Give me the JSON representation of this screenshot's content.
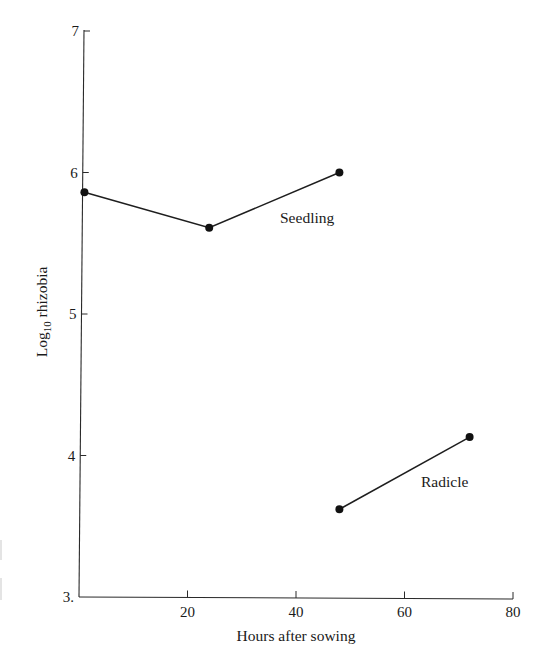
{
  "chart_data": {
    "type": "line",
    "title": "",
    "xlabel": "Hours after sowing",
    "ylabel": "Log10 rhizobia",
    "ylabel_parts": {
      "base": "Log",
      "subscript": "10",
      "rest": " rhizobia"
    },
    "xlim": [
      0,
      80
    ],
    "ylim": [
      3,
      7
    ],
    "x_ticks": [
      20,
      40,
      60,
      80
    ],
    "x_tick_labels": [
      "20",
      "40",
      "60",
      "80"
    ],
    "y_ticks": [
      3,
      4,
      5,
      6,
      7
    ],
    "y_tick_labels": [
      "3.",
      "4",
      "5",
      "6",
      "7"
    ],
    "grid": false,
    "legend": "none (series labeled inline)",
    "series": [
      {
        "name": "Seedling",
        "x": [
          1,
          24,
          48
        ],
        "y": [
          5.86,
          5.61,
          6.0
        ]
      },
      {
        "name": "Radicle",
        "x": [
          48,
          72
        ],
        "y": [
          3.62,
          4.13
        ]
      }
    ],
    "annotations": [
      {
        "text": "Seedling",
        "x": 43,
        "y": 5.65
      },
      {
        "text": "Radicle",
        "x": 68,
        "y": 3.8
      }
    ]
  }
}
